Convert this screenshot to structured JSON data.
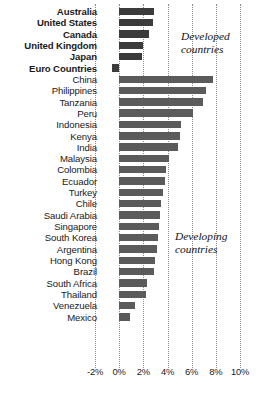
{
  "chart_data": {
    "type": "bar",
    "orientation": "horizontal",
    "title": "",
    "xlabel": "",
    "ylabel": "",
    "xlim": [
      -2,
      10
    ],
    "xticks": [
      "-2%",
      "0%",
      "2%",
      "4%",
      "6%",
      "8%",
      "10%"
    ],
    "xtick_values": [
      -2,
      0,
      2,
      4,
      6,
      8,
      10
    ],
    "grid": true,
    "grid_axis": "x",
    "legend": "none",
    "annotations": [
      {
        "text": "Developed countries",
        "line1": "Developed",
        "line2": "countries"
      },
      {
        "text": "Developing countries",
        "line1": "Developing",
        "line2": "countries"
      }
    ],
    "groups": [
      {
        "name": "Developed countries",
        "bold": true,
        "categories": [
          "Australia",
          "United States",
          "Canada",
          "United Kingdom",
          "Japan",
          "Euro Countries"
        ],
        "values": [
          2.9,
          2.8,
          2.5,
          2.0,
          1.9,
          -0.6
        ]
      },
      {
        "name": "Developing countries",
        "bold": false,
        "categories": [
          "China",
          "Philippines",
          "Tanzania",
          "Peru",
          "Indonesia",
          "Kenya",
          "India",
          "Malaysia",
          "Colombia",
          "Ecuador",
          "Turkey",
          "Chile",
          "Saudi Arabia",
          "Singapore",
          "South Korea",
          "Argentina",
          "Hong Kong",
          "Brazil",
          "South Africa",
          "Thailand",
          "Venezuela",
          "Mexico"
        ],
        "values": [
          7.8,
          7.2,
          6.9,
          6.1,
          5.1,
          5.0,
          4.9,
          4.1,
          3.9,
          3.8,
          3.6,
          3.5,
          3.4,
          3.3,
          3.2,
          3.1,
          3.0,
          2.9,
          2.3,
          2.2,
          1.3,
          0.9
        ]
      }
    ],
    "colors": {
      "bar_developed": "#3b3b3b",
      "bar_developing": "#5b5b5b",
      "grid": "#8c8c8c",
      "text": "#1a1a1a",
      "background": "#ffffff"
    }
  }
}
